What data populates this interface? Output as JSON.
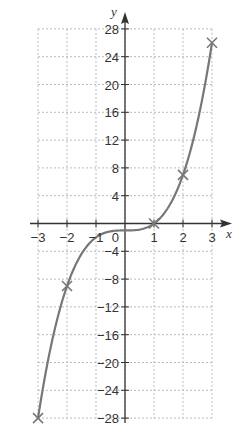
{
  "chart_data": {
    "type": "line",
    "title": "",
    "function": "y = x^3 - 1",
    "xlabel": "x",
    "ylabel": "y",
    "xlim": [
      -3,
      3
    ],
    "ylim": [
      -28,
      28
    ],
    "grid": true,
    "x_ticks": [
      -3,
      -2,
      -1,
      0,
      1,
      2,
      3
    ],
    "x_tick_labels": [
      "−3",
      "−2",
      "−1",
      "0",
      "1",
      "2",
      "3"
    ],
    "y_ticks": [
      28,
      24,
      20,
      16,
      12,
      8,
      4,
      -4,
      -8,
      -12,
      -16,
      -20,
      -24,
      -28
    ],
    "y_tick_labels": [
      "28",
      "24",
      "20",
      "16",
      "12",
      "8",
      "4",
      "−4",
      "−8",
      "−12",
      "−16",
      "−20",
      "−24",
      "−28"
    ],
    "origin_label": "0",
    "series": [
      {
        "name": "curve",
        "x": [
          -3,
          -2,
          -1,
          0,
          1,
          2,
          3
        ],
        "y": [
          -28,
          -9,
          -2,
          -1,
          0,
          7,
          26
        ]
      }
    ],
    "markers": {
      "symbol": "x",
      "points": [
        {
          "x": -3,
          "y": -28
        },
        {
          "x": -2,
          "y": -9
        },
        {
          "x": 1,
          "y": 0
        },
        {
          "x": 2,
          "y": 7
        },
        {
          "x": 3,
          "y": 26
        }
      ]
    },
    "colors": {
      "curve": "#777777",
      "axes": "#333333",
      "grid": "#bbbbbb"
    }
  }
}
